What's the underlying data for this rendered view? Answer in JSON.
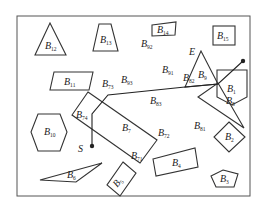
{
  "diagram": {
    "type": "path-planning-obstacle-map",
    "start_label": "S",
    "end_label": "E",
    "obstacles": [
      {
        "id": "B1",
        "base": "B",
        "sub": "1",
        "shape": "pentagon-pointed-down"
      },
      {
        "id": "B2",
        "base": "B",
        "sub": "2",
        "shape": "diamond"
      },
      {
        "id": "B3",
        "base": "B",
        "sub": "3",
        "shape": "pentagon"
      },
      {
        "id": "B4",
        "base": "B",
        "sub": "4",
        "shape": "rectangle"
      },
      {
        "id": "B5",
        "base": "B",
        "sub": "5",
        "shape": "rotated-rectangle"
      },
      {
        "id": "B6",
        "base": "B",
        "sub": "6",
        "shape": "thin-triangle"
      },
      {
        "id": "B7",
        "base": "B",
        "sub": "7",
        "shape": "rotated-rectangle"
      },
      {
        "id": "B8",
        "base": "B",
        "sub": "8",
        "shape": "triangle"
      },
      {
        "id": "B9",
        "base": "B",
        "sub": "9",
        "shape": "triangle"
      },
      {
        "id": "B10",
        "base": "B",
        "sub": "10",
        "shape": "hexagon"
      },
      {
        "id": "B11",
        "base": "B",
        "sub": "11",
        "shape": "parallelogram"
      },
      {
        "id": "B12",
        "base": "B",
        "sub": "12",
        "shape": "triangle"
      },
      {
        "id": "B13",
        "base": "B",
        "sub": "13",
        "shape": "trapezoid"
      },
      {
        "id": "B14",
        "base": "B",
        "sub": "14",
        "shape": "quadrilateral"
      },
      {
        "id": "B15",
        "base": "B",
        "sub": "15",
        "shape": "rectangle"
      }
    ],
    "vertex_labels": [
      {
        "base": "B",
        "sub": "71"
      },
      {
        "base": "B",
        "sub": "72"
      },
      {
        "base": "B",
        "sub": "73"
      },
      {
        "base": "B",
        "sub": "74"
      },
      {
        "base": "B",
        "sub": "81"
      },
      {
        "base": "B",
        "sub": "82"
      },
      {
        "base": "B",
        "sub": "83"
      },
      {
        "base": "B",
        "sub": "91"
      },
      {
        "base": "B",
        "sub": "92"
      },
      {
        "base": "B",
        "sub": "93"
      }
    ],
    "path_sequence": [
      "S",
      "B74",
      "B73",
      "B93",
      "B91",
      "E"
    ]
  }
}
